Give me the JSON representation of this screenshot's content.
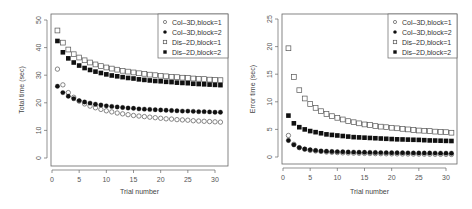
{
  "chart_data": [
    {
      "type": "scatter",
      "title": "",
      "xlabel": "Trial number",
      "ylabel": "Total time (sec)",
      "xlim": [
        0,
        31.5
      ],
      "ylim": [
        -1,
        52
      ],
      "xticks": [
        0,
        5,
        10,
        15,
        20,
        25,
        30
      ],
      "yticks": [
        0,
        10,
        20,
        30,
        40,
        50
      ],
      "grid": false,
      "legend_position": "top-right",
      "x": [
        1,
        2,
        3,
        4,
        5,
        6,
        7,
        8,
        9,
        10,
        11,
        12,
        13,
        14,
        15,
        16,
        17,
        18,
        19,
        20,
        21,
        22,
        23,
        24,
        25,
        26,
        27,
        28,
        29,
        30,
        31
      ],
      "series": [
        {
          "name": "Col–3D,block=1",
          "marker": "open-circle",
          "values": [
            32.2,
            26.5,
            23.7,
            22.0,
            20.6,
            19.6,
            18.8,
            18.2,
            17.6,
            17.1,
            16.7,
            16.3,
            16.0,
            15.7,
            15.4,
            15.2,
            15.0,
            14.8,
            14.6,
            14.4,
            14.2,
            14.1,
            13.9,
            13.8,
            13.7,
            13.5,
            13.4,
            13.3,
            13.2,
            13.1,
            13.0
          ]
        },
        {
          "name": "Col–3D,block=2",
          "marker": "filled-circle",
          "values": [
            26.0,
            23.7,
            22.4,
            21.5,
            20.8,
            20.3,
            19.9,
            19.5,
            19.2,
            18.9,
            18.7,
            18.5,
            18.3,
            18.1,
            18.0,
            17.8,
            17.7,
            17.6,
            17.5,
            17.4,
            17.3,
            17.2,
            17.1,
            17.0,
            17.0,
            16.9,
            16.8,
            16.8,
            16.7,
            16.6,
            16.6
          ]
        },
        {
          "name": "Dis–2D,block=1",
          "marker": "open-square",
          "values": [
            46.2,
            41.8,
            39.3,
            37.6,
            36.4,
            35.4,
            34.6,
            33.9,
            33.3,
            32.8,
            32.4,
            32.0,
            31.6,
            31.3,
            31.0,
            30.7,
            30.5,
            30.2,
            30.0,
            29.8,
            29.6,
            29.4,
            29.3,
            29.1,
            29.0,
            28.8,
            28.7,
            28.6,
            28.4,
            28.3,
            28.2
          ]
        },
        {
          "name": "Dis–2D,block=2",
          "marker": "filled-square",
          "values": [
            42.4,
            38.3,
            36.1,
            34.6,
            33.5,
            32.6,
            31.9,
            31.3,
            30.8,
            30.3,
            29.9,
            29.6,
            29.3,
            29.0,
            28.8,
            28.5,
            28.3,
            28.1,
            27.9,
            27.8,
            27.6,
            27.5,
            27.3,
            27.2,
            27.1,
            26.9,
            26.8,
            26.7,
            26.6,
            26.5,
            26.4
          ]
        }
      ]
    },
    {
      "type": "scatter",
      "title": "",
      "xlabel": "Trial number",
      "ylabel": "Error time (sec)",
      "xlim": [
        0,
        31.5
      ],
      "ylim": [
        -0.5,
        26
      ],
      "xticks": [
        0,
        5,
        10,
        15,
        20,
        25,
        30
      ],
      "yticks": [
        0,
        5,
        10,
        15,
        20,
        25
      ],
      "grid": false,
      "legend_position": "top-right",
      "x": [
        1,
        2,
        3,
        4,
        5,
        6,
        7,
        8,
        9,
        10,
        11,
        12,
        13,
        14,
        15,
        16,
        17,
        18,
        19,
        20,
        21,
        22,
        23,
        24,
        25,
        26,
        27,
        28,
        29,
        30,
        31
      ],
      "series": [
        {
          "name": "Col–3D,block=1",
          "marker": "open-circle",
          "values": [
            3.9,
            2.3,
            1.7,
            1.4,
            1.2,
            1.1,
            1.0,
            0.9,
            0.85,
            0.8,
            0.75,
            0.72,
            0.7,
            0.67,
            0.65,
            0.63,
            0.61,
            0.6,
            0.58,
            0.57,
            0.56,
            0.55,
            0.54,
            0.53,
            0.52,
            0.51,
            0.5,
            0.49,
            0.48,
            0.47,
            0.46
          ]
        },
        {
          "name": "Col–3D,block=2",
          "marker": "filled-circle",
          "values": [
            3.0,
            2.2,
            1.7,
            1.45,
            1.3,
            1.2,
            1.1,
            1.05,
            1.0,
            0.97,
            0.94,
            0.91,
            0.89,
            0.87,
            0.85,
            0.83,
            0.82,
            0.8,
            0.79,
            0.78,
            0.77,
            0.76,
            0.75,
            0.74,
            0.73,
            0.72,
            0.72,
            0.71,
            0.7,
            0.7,
            0.69
          ]
        },
        {
          "name": "Dis–2D,block=1",
          "marker": "open-square",
          "values": [
            19.7,
            14.5,
            12.1,
            10.6,
            9.6,
            8.9,
            8.3,
            7.8,
            7.4,
            7.1,
            6.8,
            6.5,
            6.3,
            6.1,
            5.9,
            5.8,
            5.6,
            5.5,
            5.4,
            5.3,
            5.2,
            5.1,
            5.0,
            4.9,
            4.8,
            4.75,
            4.7,
            4.6,
            4.55,
            4.5,
            4.4
          ]
        },
        {
          "name": "Dis–2D,block=2",
          "marker": "filled-square",
          "values": [
            7.5,
            6.1,
            5.4,
            5.0,
            4.7,
            4.5,
            4.3,
            4.1,
            4.0,
            3.9,
            3.8,
            3.7,
            3.6,
            3.55,
            3.5,
            3.45,
            3.4,
            3.35,
            3.3,
            3.25,
            3.2,
            3.18,
            3.15,
            3.12,
            3.1,
            3.05,
            3.0,
            2.98,
            2.95,
            2.92,
            2.9
          ]
        }
      ]
    }
  ]
}
